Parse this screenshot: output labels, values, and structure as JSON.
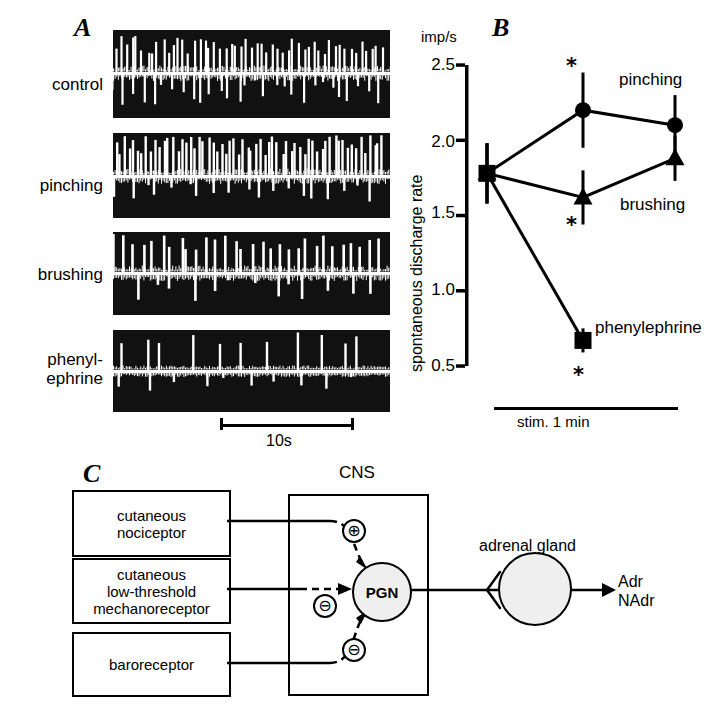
{
  "figure": {
    "panels": [
      {
        "letter": "A"
      },
      {
        "letter": "B"
      },
      {
        "letter": "C"
      }
    ]
  },
  "panel_a": {
    "letter": "A",
    "traces": [
      {
        "label": "control"
      },
      {
        "label": "pinching"
      },
      {
        "label": "brushing"
      },
      {
        "label": "phenyl-",
        "label2": "ephrine"
      }
    ],
    "scalebar": {
      "text": "10s"
    }
  },
  "panel_b": {
    "letter": "B",
    "unit": "imp/s",
    "ylabel": "spontaneous discharge rate",
    "stim_label": "stim. 1 min",
    "significance_marker": "*",
    "chart_data": {
      "type": "line",
      "title": "",
      "xlabel": "",
      "ylabel": "spontaneous discharge rate",
      "yunit": "imp/s",
      "ylim": [
        0.5,
        2.5
      ],
      "yticks": [
        0.5,
        1.0,
        1.5,
        2.0,
        2.5
      ],
      "ytick_labels": [
        "0.5",
        "1.0",
        "1.5",
        "2.0",
        "2.5"
      ],
      "x": [
        "before",
        "during stim.",
        "after"
      ],
      "grid": false,
      "legend_position": "inline-right",
      "series": [
        {
          "name": "pinching",
          "marker": "filled-circle",
          "values": [
            1.78,
            2.2,
            2.1
          ],
          "errors": [
            0.2,
            0.25,
            0.2
          ],
          "significant": [
            false,
            true,
            false
          ]
        },
        {
          "name": "brushing",
          "marker": "filled-triangle",
          "values": [
            1.78,
            1.62,
            1.88
          ],
          "errors": [
            0.2,
            0.18,
            0.15
          ],
          "significant": [
            false,
            true,
            false
          ]
        },
        {
          "name": "phenylephrine",
          "marker": "filled-square",
          "values": [
            1.78,
            0.67,
            null
          ],
          "errors": [
            0.2,
            0.08,
            null
          ],
          "significant": [
            false,
            true,
            false
          ]
        }
      ],
      "annotations": [
        "stim. 1 min",
        "*"
      ]
    },
    "series_labels": {
      "pinching": "pinching",
      "brushing": "brushing",
      "phenylephrine": "phenylephrine"
    }
  },
  "panel_c": {
    "letter": "C",
    "inputs": [
      {
        "name": "cutaneous-nociceptor",
        "line1": "cutaneous",
        "line2": "nociceptor",
        "line3": "",
        "sign": "⊕"
      },
      {
        "name": "cutaneous-low-threshold-mechanoreceptor",
        "line1": "cutaneous",
        "line2": "low-threshold",
        "line3": "mechanoreceptor",
        "sign": "⊖"
      },
      {
        "name": "baroreceptor",
        "line1": "baroreceptor",
        "line2": "",
        "line3": "",
        "sign": "⊖"
      }
    ],
    "cns_label": "CNS",
    "pgn_label": "PGN",
    "gland_label": "adrenal gland",
    "output_line1": "Adr",
    "output_line2": "NAdr"
  }
}
